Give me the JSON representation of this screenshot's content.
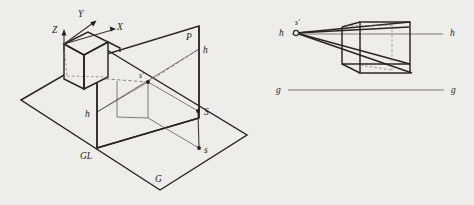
{
  "figure": {
    "background_color": "#efedea",
    "ink_color": "#2a2523"
  },
  "left_diagram": {
    "name": "spatial-setup",
    "description": "Axonometric view of ground plane G, picture plane P, station point S and its projections",
    "labels": {
      "axis_z": "Z",
      "axis_y": "Y",
      "axis_x": "X",
      "picture_plane": "P",
      "horizon_right": "h",
      "horizon_left": "h",
      "ground_line": "GL",
      "ground_plane": "G",
      "station_point": "S",
      "station_plan": "s",
      "eye_point_image": "s'"
    }
  },
  "right_diagram": {
    "name": "perspective-image",
    "description": "Resulting perspective drawing with horizon line h-h, ground line g-g and vanishing point s'",
    "labels": {
      "horizon_left": "h",
      "horizon_right": "h",
      "vanishing_point": "s'",
      "ground_left": "g",
      "ground_right": "g"
    }
  }
}
